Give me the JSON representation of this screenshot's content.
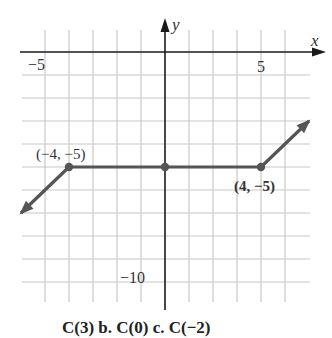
{
  "chart_data": {
    "type": "line",
    "title": "",
    "xlabel": "x",
    "ylabel": "y",
    "xlim": [
      -6,
      6
    ],
    "ylim": [
      -11,
      1
    ],
    "grid": true,
    "x_tick_labels": [
      {
        "value": -5,
        "label": "−5"
      },
      {
        "value": 5,
        "label": "5"
      }
    ],
    "y_tick_labels": [
      {
        "value": -10,
        "label": "−10"
      }
    ],
    "series": [
      {
        "name": "C(x)",
        "points": [
          {
            "x": -6,
            "y": -7
          },
          {
            "x": -4,
            "y": -5
          },
          {
            "x": 0,
            "y": -5
          },
          {
            "x": 4,
            "y": -5
          },
          {
            "x": 6,
            "y": -3
          }
        ],
        "left_arrow": true,
        "right_arrow": true
      }
    ],
    "highlighted_points": [
      {
        "x": -4,
        "y": -5,
        "label": "(−4, −5)"
      },
      {
        "x": 0,
        "y": -5,
        "label": ""
      },
      {
        "x": 4,
        "y": -5,
        "label": "(4, −5)"
      }
    ],
    "annotations": {
      "caption": "C(3)   b.  C(0)    c.  C(−2)"
    }
  },
  "colors": {
    "axis": "#1a1a1a",
    "grid": "#c8c8c8",
    "curve": "#555555",
    "text": "#333333"
  }
}
